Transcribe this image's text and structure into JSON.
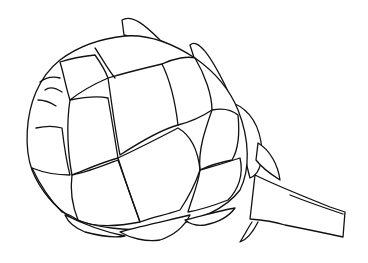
{
  "image": {
    "subject": "artichoke line drawing",
    "background": "#ffffff",
    "stroke_color": "#111111"
  }
}
